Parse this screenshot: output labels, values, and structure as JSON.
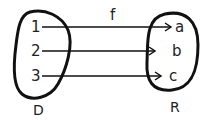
{
  "diagram": {
    "type": "function-mapping",
    "function_label": "f",
    "domain": {
      "label": "D",
      "elements": [
        "1",
        "2",
        "3"
      ]
    },
    "range": {
      "label": "R",
      "elements": [
        "a",
        "b",
        "c"
      ]
    },
    "mappings": [
      {
        "from": "1",
        "to": "a"
      },
      {
        "from": "2",
        "to": "b"
      },
      {
        "from": "3",
        "to": "c"
      }
    ],
    "colors": {
      "ink": "#111111",
      "background": "#ffffff"
    }
  }
}
